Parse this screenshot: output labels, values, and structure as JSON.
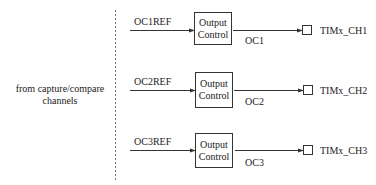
{
  "diagram": {
    "source_label_line1": "from capture/compare",
    "source_label_line2": "channels",
    "channels": [
      {
        "ref_label": "OC1REF",
        "block_line1": "Output",
        "block_line2": "Control",
        "out_label": "OC1",
        "pin_label": "TIMx_CH1"
      },
      {
        "ref_label": "OC2REF",
        "block_line1": "Output",
        "block_line2": "Control",
        "out_label": "OC2",
        "pin_label": "TIMx_CH2"
      },
      {
        "ref_label": "OC3REF",
        "block_line1": "Output",
        "block_line2": "Control",
        "out_label": "OC3",
        "pin_label": "TIMx_CH3"
      }
    ],
    "colors": {
      "line": "#333333",
      "text": "#222222",
      "divider": "#777777"
    }
  }
}
